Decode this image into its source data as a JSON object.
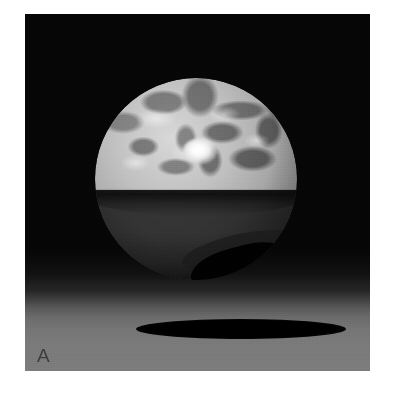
{
  "figure": {
    "panel_label": "A",
    "label_color": "#3d3d3d",
    "background_color": "#ffffff",
    "panel_background_color": "#060606"
  },
  "scene": {
    "type": "3d-render",
    "color_mode": "grayscale",
    "elements": {
      "sphere": {
        "name": "sphere",
        "center_x": 196,
        "center_y": 179,
        "radius": 101,
        "surface": "mottled-marbled-texture",
        "lit_side": "upper",
        "lit_tone": "#c2c2c2",
        "shaded_tone": "#2a2a2a",
        "terminator_y": 185,
        "specular_highlight": {
          "name": "specular-highlight",
          "center_x": 172,
          "center_y": 137,
          "color": "#ffffff"
        },
        "crescent_sliver": {
          "name": "dark-crescent",
          "position": "lower-right",
          "color": "#000000"
        }
      },
      "ground_plane": {
        "name": "ground-plane",
        "top_y": 272,
        "bottom_y": 371,
        "gradient_from": "#050505",
        "gradient_to": "#7c7c7c"
      },
      "cast_shadow": {
        "name": "cast-shadow",
        "center_x": 241,
        "center_y": 329,
        "width": 210,
        "height": 20,
        "color": "#000000"
      }
    }
  }
}
